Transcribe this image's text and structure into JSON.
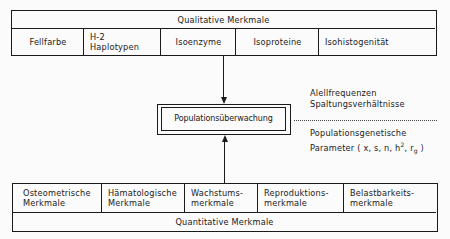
{
  "top_box": {
    "header": "Qualitative  Merkmale",
    "cells": [
      {
        "label": "Fellfarbe"
      },
      {
        "label_line1": "H-2",
        "label_line2": "Haplotypen"
      },
      {
        "label": "Isoenzyme"
      },
      {
        "label": "Isoproteine"
      },
      {
        "label": "Isohistogenität"
      }
    ]
  },
  "center_box": {
    "label": "Populationsüberwachung"
  },
  "right_notes": {
    "upper_line1": "Alellfrequenzen",
    "upper_line2": "Spaltungsverhältnisse",
    "lower_line1": "Populationsgenetische",
    "lower_line2_prefix": "Parameter ( x, s, n, h",
    "lower_line2_sup": "2",
    "lower_line2_mid": ", r",
    "lower_line2_sub": "g",
    "lower_line2_suffix": " )"
  },
  "bottom_box": {
    "footer": "Quantitative  Merkmale",
    "cells": [
      {
        "line1": "Osteometrische",
        "line2": "Merkmale"
      },
      {
        "line1": "Hämatologische",
        "line2": "Merkmale"
      },
      {
        "line1": "Wachstums-",
        "line2": "merkmale"
      },
      {
        "line1": "Reproduktions-",
        "line2": "merkmale"
      },
      {
        "line1": "Belastbarkeits-",
        "line2": "merkmale"
      }
    ]
  }
}
